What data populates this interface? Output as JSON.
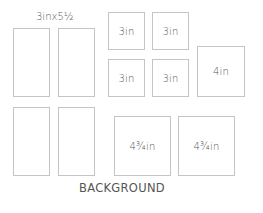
{
  "group_label": "3inx5½",
  "footer_label": "BACKGROUND",
  "frames": [
    {
      "id": "tall-1",
      "size": "3inx5½",
      "label": ""
    },
    {
      "id": "tall-2",
      "size": "3inx5½",
      "label": ""
    },
    {
      "id": "tall-3",
      "size": "3inx5½",
      "label": ""
    },
    {
      "id": "tall-4",
      "size": "3inx5½",
      "label": ""
    },
    {
      "id": "small-1",
      "size": "3in",
      "label": "3in"
    },
    {
      "id": "small-2",
      "size": "3in",
      "label": "3in"
    },
    {
      "id": "small-3",
      "size": "3in",
      "label": "3in"
    },
    {
      "id": "small-4",
      "size": "3in",
      "label": "3in"
    },
    {
      "id": "medium-1",
      "size": "4in",
      "label": "4in"
    },
    {
      "id": "large-1",
      "size": "4¾in",
      "label": "4¾in"
    },
    {
      "id": "large-2",
      "size": "4¾in",
      "label": "4¾in"
    }
  ]
}
